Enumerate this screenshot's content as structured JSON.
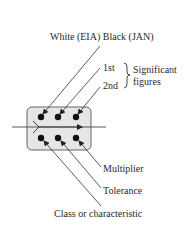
{
  "diagram": {
    "title_label": "White (EIA) Black (JAN)",
    "significant": {
      "first": "1st",
      "second": "2nd",
      "brace_label_line1": "Significant",
      "brace_label_line2": "figures"
    },
    "bottom_labels": {
      "multiplier": "Multiplier",
      "tolerance": "Tolerance",
      "class": "Class or characteristic"
    },
    "colors": {
      "box_fill": "#e6e6e6",
      "box_stroke": "#555555",
      "dot": "#111111",
      "line": "#333333"
    }
  }
}
